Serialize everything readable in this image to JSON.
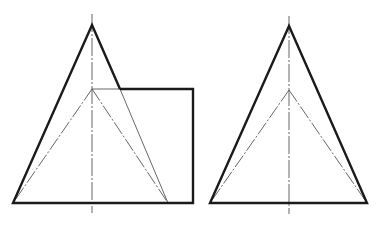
{
  "figure": {
    "colors": {
      "outline": "#1a1a1a",
      "hidden_and_center": "#555555",
      "background": "#ffffff"
    },
    "left_view": {
      "apex": [
        92,
        25
      ],
      "base_left": [
        13,
        203
      ],
      "base_right": [
        193,
        203
      ],
      "rect_top_y": 89,
      "rect_right_x": 193,
      "inner_apex": [
        92,
        89
      ],
      "inner_base_right": [
        168,
        203
      ],
      "centerline": {
        "x": 92,
        "y1": 14,
        "y2": 213
      }
    },
    "right_view": {
      "apex": [
        289,
        26
      ],
      "base_left": [
        210,
        203
      ],
      "base_right": [
        367,
        203
      ],
      "inner_apex": [
        289,
        90
      ],
      "centerline": {
        "x": 289,
        "y1": 16,
        "y2": 214
      }
    }
  }
}
